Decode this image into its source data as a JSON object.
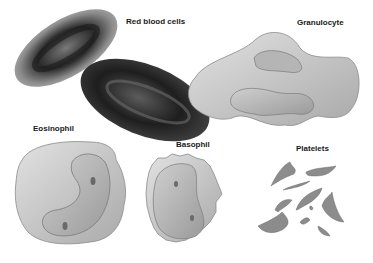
{
  "figure": {
    "background": "#ffffff",
    "labels": {
      "red_blood_cells": "Red blood cells",
      "granulocyte": "Granulocyte",
      "eosinophil": "Eosinophil",
      "basophil": "Basophil",
      "platelets": "Platelets"
    },
    "cells": [
      {
        "name": "Red blood cells",
        "count": 2,
        "shade": "#3a3a3a"
      },
      {
        "name": "Granulocyte",
        "count": 1,
        "shade": "#cfcfcf"
      },
      {
        "name": "Eosinophil",
        "count": 1,
        "shade": "#c8c8c8"
      },
      {
        "name": "Basophil",
        "count": 1,
        "shade": "#d0d0d0"
      },
      {
        "name": "Platelets",
        "count": 10,
        "shade": "#8a8a8a"
      }
    ]
  }
}
